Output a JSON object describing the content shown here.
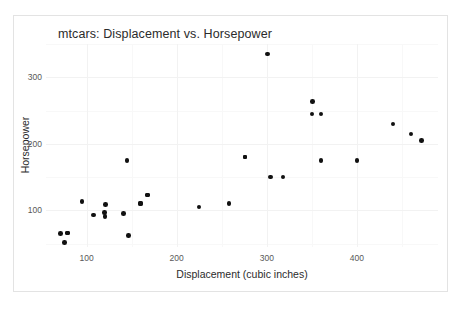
{
  "chart_data": {
    "type": "scatter",
    "title": "mtcars: Displacement vs. Horsepower",
    "xlabel": "Displacement (cubic inches)",
    "ylabel": "Horsepower",
    "xlim": [
      55,
      490
    ],
    "ylim": [
      45,
      350
    ],
    "xticks": [
      100,
      200,
      300,
      400
    ],
    "xticklabels": [
      "100",
      "200",
      "300",
      "400"
    ],
    "yticks": [
      100,
      200,
      300
    ],
    "yticklabels": [
      "100",
      "200",
      "300"
    ],
    "grid": true,
    "legend": null,
    "marker": {
      "shape": "circle",
      "color": "#111111",
      "size_px": 4.6
    },
    "x": [
      160,
      160,
      108,
      258,
      360,
      225,
      360,
      146.7,
      140.8,
      167.6,
      167.6,
      275.8,
      275.8,
      275.8,
      472,
      460,
      440,
      78.7,
      75.7,
      71.1,
      120.1,
      318,
      304,
      350,
      400,
      79,
      120.3,
      95.1,
      351,
      145,
      301,
      121
    ],
    "y": [
      110,
      110,
      93,
      110,
      175,
      105,
      245,
      62,
      95,
      123,
      123,
      180,
      180,
      180,
      205,
      215,
      230,
      66,
      52,
      65,
      97,
      150,
      150,
      245,
      175,
      66,
      91,
      113,
      264,
      175,
      335,
      109
    ],
    "n_points": 32,
    "series_name": "mtcars"
  },
  "plot": {
    "title": "mtcars: Displacement vs. Horsepower",
    "x_axis_title": "Displacement (cubic inches)",
    "y_axis_title": "Horsepower"
  }
}
